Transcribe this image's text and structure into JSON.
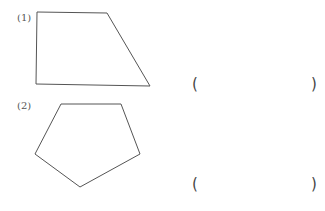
{
  "problems": [
    {
      "label": "(1)",
      "shape": "trapezoid",
      "answer_open": "(",
      "answer_close": ")",
      "answer_value": ""
    },
    {
      "label": "(2)",
      "shape": "pentagon",
      "answer_open": "(",
      "answer_close": ")",
      "answer_value": ""
    }
  ],
  "colors": {
    "stroke": "#555555"
  }
}
